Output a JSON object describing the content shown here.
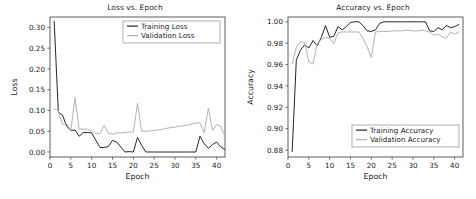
{
  "figure": {
    "background_color": "#ffffff",
    "panels": [
      "loss",
      "accuracy"
    ]
  },
  "chart_data": [
    {
      "type": "line",
      "title": "Loss vs. Epoch",
      "xlabel": "Epoch",
      "ylabel": "Loss",
      "xlim": [
        0,
        42
      ],
      "ylim": [
        -0.012,
        0.325
      ],
      "xticks": [
        0,
        5,
        10,
        15,
        20,
        25,
        30,
        35,
        40
      ],
      "xtick_labels": [
        "0",
        "5",
        "10",
        "15",
        "20",
        "25",
        "30",
        "35",
        "40"
      ],
      "yticks": [
        0.0,
        0.05,
        0.1,
        0.15,
        0.2,
        0.25,
        0.3
      ],
      "ytick_labels": [
        "0.00",
        "0.05",
        "0.10",
        "0.15",
        "0.20",
        "0.25",
        "0.30"
      ],
      "grid": false,
      "legend_position": "upper right",
      "x": [
        1,
        2,
        3,
        4,
        5,
        6,
        7,
        8,
        9,
        10,
        11,
        12,
        13,
        14,
        15,
        16,
        17,
        18,
        19,
        20,
        21,
        22,
        23,
        24,
        25,
        26,
        27,
        28,
        29,
        30,
        31,
        32,
        33,
        34,
        35,
        36,
        37,
        38,
        39,
        40,
        41
      ],
      "series": [
        {
          "name": "Training Loss",
          "color": "#262626",
          "values": [
            0.315,
            0.096,
            0.089,
            0.062,
            0.052,
            0.053,
            0.038,
            0.047,
            0.047,
            0.046,
            0.028,
            0.011,
            0.011,
            0.013,
            0.028,
            0.024,
            0.012,
            0.0,
            0.001,
            0.0,
            0.035,
            0.016,
            0.0,
            0.0,
            0.0,
            0.0,
            0.0,
            0.0,
            0.0,
            0.0,
            0.0,
            0.0,
            0.0,
            0.0,
            0.0,
            0.038,
            0.02,
            0.009,
            0.018,
            0.024,
            0.012,
            0.006
          ]
        },
        {
          "name": "Validation Loss",
          "color": "#b3b3b3",
          "values": [
            0.103,
            0.1,
            0.066,
            0.069,
            0.052,
            0.131,
            0.055,
            0.055,
            0.055,
            0.05,
            0.045,
            0.044,
            0.064,
            0.046,
            0.043,
            0.046,
            0.046,
            0.047,
            0.048,
            0.048,
            0.117,
            0.05,
            0.05,
            0.051,
            0.052,
            0.053,
            0.055,
            0.057,
            0.059,
            0.06,
            0.062,
            0.063,
            0.065,
            0.067,
            0.07,
            0.07,
            0.046,
            0.106,
            0.052,
            0.066,
            0.062,
            0.037
          ]
        }
      ]
    },
    {
      "type": "line",
      "title": "Accuracy vs. Epoch",
      "xlabel": "Epoch",
      "ylabel": "Accuracy",
      "xlim": [
        0,
        42
      ],
      "ylim": [
        0.8735,
        1.0045
      ],
      "xticks": [
        0,
        5,
        10,
        15,
        20,
        25,
        30,
        35,
        40
      ],
      "xtick_labels": [
        "0",
        "5",
        "10",
        "15",
        "20",
        "25",
        "30",
        "35",
        "40"
      ],
      "yticks": [
        0.88,
        0.9,
        0.92,
        0.94,
        0.96,
        0.98,
        1.0
      ],
      "ytick_labels": [
        "0.88",
        "0.90",
        "0.92",
        "0.94",
        "0.96",
        "0.98",
        "1.00"
      ],
      "grid": false,
      "legend_position": "lower right",
      "x": [
        1,
        2,
        3,
        4,
        5,
        6,
        7,
        8,
        9,
        10,
        11,
        12,
        13,
        14,
        15,
        16,
        17,
        18,
        19,
        20,
        21,
        22,
        23,
        24,
        25,
        26,
        27,
        28,
        29,
        30,
        31,
        32,
        33,
        34,
        35,
        36,
        37,
        38,
        39,
        40,
        41
      ],
      "series": [
        {
          "name": "Training Accuracy",
          "color": "#262626",
          "values": [
            0.8785,
            0.9645,
            0.9735,
            0.9785,
            0.9755,
            0.9825,
            0.9775,
            0.9855,
            0.9965,
            0.9855,
            0.9865,
            0.9955,
            0.9925,
            0.9955,
            0.9995,
            1.0,
            1.0,
            0.9965,
            0.9915,
            0.991,
            0.9925,
            0.9985,
            1.0,
            1.0,
            1.0,
            1.0,
            1.0,
            1.0,
            1.0,
            1.0,
            1.0,
            1.0,
            1.0,
            0.9915,
            0.991,
            0.9945,
            0.9925,
            0.9965,
            0.9945,
            0.9955,
            0.9975
          ]
        },
        {
          "name": "Validation Accuracy",
          "color": "#b3b3b3",
          "values": [
            0.9605,
            0.9765,
            0.9815,
            0.9805,
            0.9625,
            0.9605,
            0.9795,
            0.9835,
            0.9855,
            0.9845,
            0.9795,
            0.9895,
            0.9905,
            0.9905,
            0.9905,
            0.9905,
            0.9905,
            0.9845,
            0.9765,
            0.9665,
            0.9905,
            0.991,
            0.991,
            0.991,
            0.9915,
            0.9915,
            0.9915,
            0.992,
            0.992,
            0.9915,
            0.9915,
            0.992,
            0.9915,
            0.9905,
            0.9875,
            0.9885,
            0.986,
            0.9845,
            0.9905,
            0.9885,
            0.9905
          ]
        }
      ]
    }
  ]
}
